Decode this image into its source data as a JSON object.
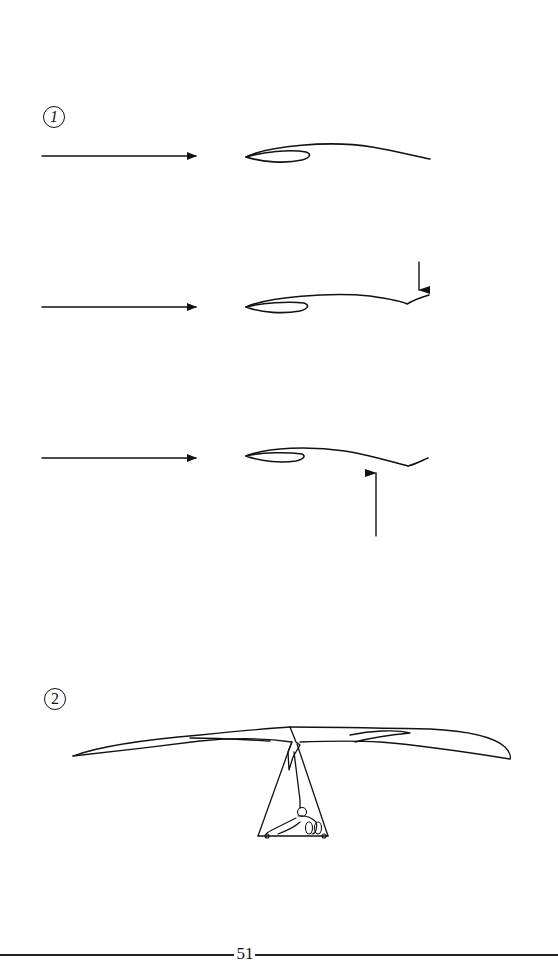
{
  "page": {
    "page_number": "51",
    "background": "#ffffff",
    "ink_color": "#111111"
  },
  "figures": [
    {
      "label": "1",
      "description": "Airflow over wing cross-section (airfoil) with trailing edge deflection",
      "panels": [
        {
          "airflow_arrow": "right-arrow",
          "airfoil": "neutral",
          "force_arrow": null
        },
        {
          "airflow_arrow": "right-arrow",
          "airfoil": "trailing-edge-down",
          "force_arrow": "down-arrow"
        },
        {
          "airflow_arrow": "right-arrow",
          "airfoil": "trailing-edge-reflex",
          "force_arrow": "up-arrow"
        }
      ]
    },
    {
      "label": "2",
      "description": "Front view of hang glider with pilot in prone position hanging below control frame"
    }
  ]
}
